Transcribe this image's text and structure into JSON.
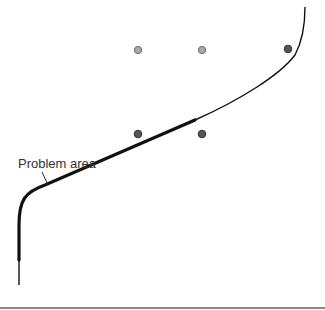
{
  "diagram": {
    "annotation": "Problem area",
    "colors": {
      "curve": "#111111",
      "dot_light": "#a9a9a9",
      "dot_dark": "#555555",
      "baseline": "#888888"
    },
    "dots": [
      {
        "x": 138,
        "y": 50,
        "shade": "light"
      },
      {
        "x": 202,
        "y": 50,
        "shade": "light"
      },
      {
        "x": 288,
        "y": 49,
        "shade": "dark"
      },
      {
        "x": 138,
        "y": 134,
        "shade": "dark"
      },
      {
        "x": 202,
        "y": 134,
        "shade": "dark"
      }
    ]
  }
}
